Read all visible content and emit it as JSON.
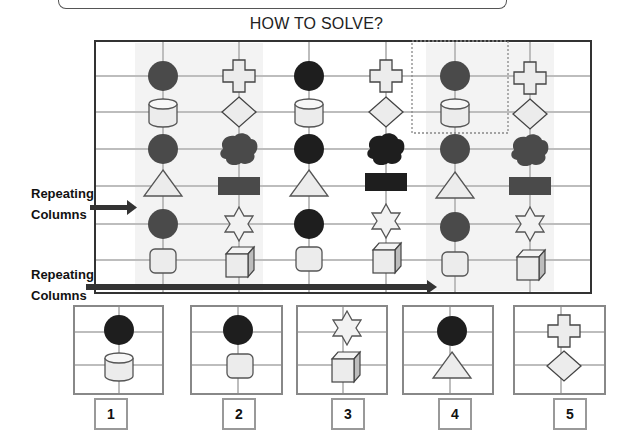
{
  "title": "HOW TO SOLVE?",
  "annotations": {
    "repeating_columns_1": [
      "Repeating",
      "Columns"
    ],
    "repeating_columns_2": [
      "Repeating",
      "Columns"
    ]
  },
  "grid": {
    "columns": 6,
    "rows": 6,
    "shaded_columns": [
      1,
      2,
      5,
      6
    ],
    "highlighted_cell": {
      "column": 5,
      "rows": [
        1,
        2
      ],
      "style": "dotted"
    },
    "cells": [
      [
        "dark-circle",
        "cross",
        "dark-circle",
        "cross",
        "dark-circle",
        "cross"
      ],
      [
        "cylinder",
        "diamond",
        "cylinder",
        "diamond",
        "cylinder",
        "diamond"
      ],
      [
        "dark-circle",
        "dark-cloud",
        "dark-circle",
        "dark-cloud",
        "dark-circle",
        "dark-cloud"
      ],
      [
        "triangle",
        "dark-rectangle",
        "triangle",
        "dark-rectangle",
        "triangle",
        "dark-rectangle"
      ],
      [
        "dark-circle",
        "star",
        "dark-circle",
        "star",
        "dark-circle",
        "star"
      ],
      [
        "rounded-square",
        "cube",
        "rounded-square",
        "cube",
        "rounded-square",
        "cube"
      ]
    ]
  },
  "options": [
    {
      "number": "1",
      "shapes": [
        "dark-circle",
        "cylinder"
      ]
    },
    {
      "number": "2",
      "shapes": [
        "dark-circle",
        "rounded-square"
      ]
    },
    {
      "number": "3",
      "shapes": [
        "star",
        "cube"
      ]
    },
    {
      "number": "4",
      "shapes": [
        "dark-circle",
        "triangle"
      ]
    },
    {
      "number": "5",
      "shapes": [
        "cross",
        "diamond"
      ]
    }
  ],
  "colors": {
    "dark_fill_outer": "#4a4a4a",
    "dark_fill_middle": "#1e1e1e",
    "light_fill": "#ececec",
    "grid_line": "#bdbdbd",
    "frame": "#333333",
    "shade": "#f3f3f3"
  }
}
